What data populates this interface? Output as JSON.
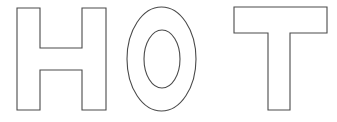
{
  "image": {
    "type": "line-art",
    "subject": "word-outline",
    "word": "HOT",
    "style": "block capital letters drawn as thin outlines, uncolored",
    "background_color": "#ffffff",
    "stroke_color": "#4a4a4a",
    "fill_color": "#ffffff",
    "stroke_width_px": 1,
    "width_px": 337,
    "height_px": 122
  },
  "letters": [
    {
      "character": "H",
      "name": "letter-h",
      "order": 1,
      "bbox": {
        "x": 17,
        "y": 8,
        "width": 89,
        "height": 102
      },
      "stem_width_px": 23,
      "crossbar": {
        "top_y": 48,
        "bottom_y": 70
      },
      "path": "M17,8 L40,8 L40,48 L82,48 L82,8 L106,8 L106,110 L82,110 L82,70 L40,70 L40,110 L17,110 Z"
    },
    {
      "character": "O",
      "name": "letter-o",
      "order": 2,
      "bbox": {
        "x": 127,
        "y": 7,
        "width": 69,
        "height": 104
      },
      "outer_ellipse": {
        "cx": 161.5,
        "cy": 59,
        "rx": 34.5,
        "ry": 52
      },
      "inner_ellipse": {
        "cx": 162,
        "cy": 59,
        "rx": 18,
        "ry": 29
      }
    },
    {
      "character": "T",
      "name": "letter-t",
      "order": 3,
      "bbox": {
        "x": 234,
        "y": 7,
        "width": 93,
        "height": 103
      },
      "bar": {
        "top_y": 7,
        "bottom_y": 33,
        "left_x": 234,
        "right_x": 327
      },
      "stem": {
        "left_x": 268,
        "right_x": 290,
        "bottom_y": 110
      },
      "path": "M234,7 L327,7 L327,33 L290,33 L290,110 L268,110 L268,33 L234,33 Z"
    }
  ]
}
